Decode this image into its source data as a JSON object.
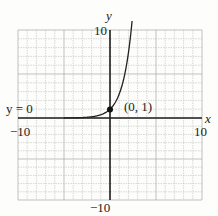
{
  "chart_data": {
    "type": "line",
    "title": "",
    "xlabel": "x",
    "ylabel": "y",
    "xlim": [
      -10,
      10
    ],
    "ylim": [
      -10,
      10
    ],
    "grid": true,
    "grid_step": 1,
    "x_ticks_labeled": [
      "-10",
      "10"
    ],
    "y_ticks_labeled": [
      "10",
      "-10"
    ],
    "series": [
      {
        "name": "y = e^x (exponential growth)",
        "x": [
          -10,
          -6,
          -4,
          -3,
          -2,
          -1,
          0,
          1,
          1.5,
          2,
          2.3
        ],
        "y": [
          0.0,
          0.0,
          0.02,
          0.05,
          0.14,
          0.37,
          1,
          2.72,
          4.48,
          7.39,
          10
        ]
      }
    ],
    "annotations": [
      {
        "text": "(0, 1)",
        "x": 0,
        "y": 1,
        "marker": "dot"
      },
      {
        "text": "y = 0",
        "note": "horizontal asymptote label on left side of x-axis"
      }
    ]
  },
  "labels": {
    "x_axis": "x",
    "y_axis": "y",
    "x_min": "−10",
    "x_max": "10",
    "y_max": "10",
    "y_min": "−10",
    "point": "(0, 1)",
    "asymptote": "y = 0"
  }
}
